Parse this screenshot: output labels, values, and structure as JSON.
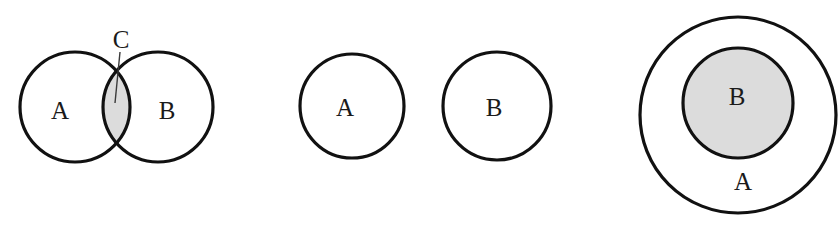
{
  "figure": {
    "background_color": "#ffffff",
    "stroke_color": "#111111",
    "shade_color": "#dcdcdc",
    "leader_color": "#3a3a3a",
    "width": 839,
    "height": 229,
    "caption": "",
    "diagrams": [
      {
        "id": "overlapping-sets",
        "name": "intersecting-circles",
        "description": "Two overlapping circles A and B with shaded lens-shaped intersection labelled C",
        "relation": "intersection",
        "circles": [
          {
            "label": "A",
            "cx": 75,
            "cy": 107,
            "r": 55,
            "fill": "none",
            "label_x": 60,
            "label_y": 110
          },
          {
            "label": "B",
            "cx": 158,
            "cy": 107,
            "r": 55,
            "fill": "none",
            "label_x": 167,
            "label_y": 110
          }
        ],
        "shaded_region": {
          "label": "C",
          "fill": "#dcdcdc",
          "label_x": 121,
          "label_y": 39
        },
        "leader": {
          "x1": 120,
          "y1": 52,
          "x2": 115,
          "y2": 103
        }
      },
      {
        "id": "disjoint-sets",
        "name": "separate-circles",
        "description": "Two non-overlapping circles A and B",
        "relation": "disjoint",
        "circles": [
          {
            "label": "A",
            "cx": 352,
            "cy": 106,
            "r": 52,
            "fill": "none",
            "label_x": 345,
            "label_y": 107
          },
          {
            "label": "B",
            "cx": 497,
            "cy": 106,
            "r": 54,
            "fill": "none",
            "label_x": 494,
            "label_y": 107
          }
        ],
        "shaded_region": null,
        "leader": null
      },
      {
        "id": "subset-sets",
        "name": "nested-circles",
        "description": "Circle B shaded and contained entirely within circle A",
        "relation": "subset",
        "circles": [
          {
            "label": "A",
            "cx": 738,
            "cy": 115,
            "r": 98,
            "fill": "none",
            "label_x": 743,
            "label_y": 181
          },
          {
            "label": "B",
            "cx": 738,
            "cy": 103,
            "r": 55,
            "fill": "#dcdcdc",
            "label_x": 737,
            "label_y": 96
          }
        ],
        "shaded_region": null,
        "leader": null
      }
    ]
  }
}
